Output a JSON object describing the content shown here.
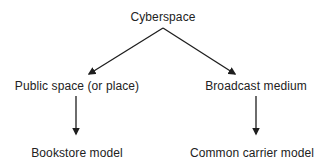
{
  "diagram": {
    "type": "tree",
    "text_color": "#222222",
    "arrow_color": "#1e1e1e",
    "nodes": {
      "root": {
        "label": "Cyberspace",
        "x": 163,
        "y": 17
      },
      "left_mid": {
        "label": "Public space (or place)",
        "x": 77,
        "y": 86
      },
      "right_mid": {
        "label": "Broadcast medium",
        "x": 256,
        "y": 86
      },
      "left_leaf": {
        "label": "Bookstore model",
        "x": 77,
        "y": 153
      },
      "right_leaf": {
        "label": "Common carrier model",
        "x": 252,
        "y": 153
      }
    },
    "edges": [
      {
        "from": "Cyberspace",
        "to": "Public space (or place)"
      },
      {
        "from": "Cyberspace",
        "to": "Broadcast medium"
      },
      {
        "from": "Public space (or place)",
        "to": "Bookstore model"
      },
      {
        "from": "Broadcast medium",
        "to": "Common carrier model"
      }
    ]
  }
}
